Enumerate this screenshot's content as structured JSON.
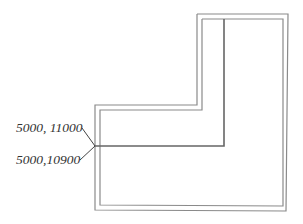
{
  "diagram": {
    "type": "floor-plan-outline",
    "annotations": [
      {
        "id": "upper",
        "text": "5000, 11000"
      },
      {
        "id": "lower",
        "text": "5000,10900"
      }
    ],
    "colors": {
      "line": "#6a6a6a",
      "text": "#333333",
      "background": "#ffffff"
    }
  }
}
